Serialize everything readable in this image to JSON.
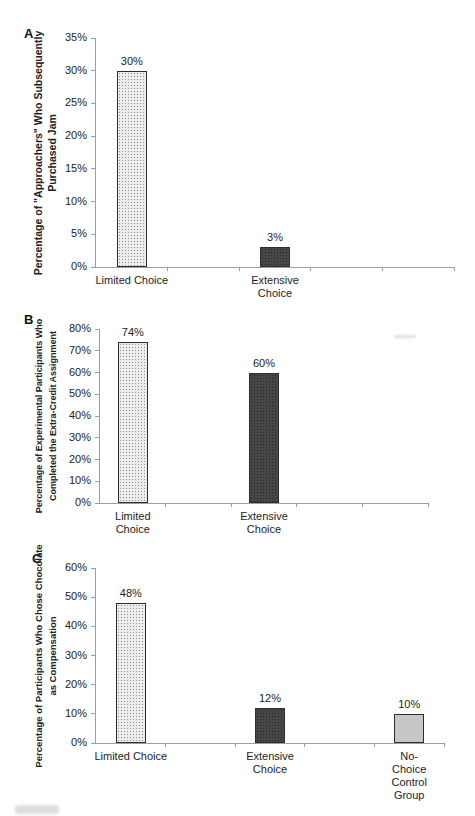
{
  "figure": {
    "background": "#ffffff",
    "panel_letters": [
      "A",
      "B",
      "C"
    ]
  },
  "palette": {
    "bar_stipple_bg": "#ececec",
    "bar_stipple_dot": "#8f8f8f",
    "bar_dark_bg": "#474747",
    "bar_dark_dot": "#262626",
    "bar_plain_gray": "#c5c8c6",
    "bar_border": "#2e2e2e",
    "axis_line": "#9e9e9e",
    "text": "#1c1c1c"
  },
  "chart_data": [
    {
      "type": "bar",
      "panel": "A",
      "title": "",
      "xlabel": "",
      "ylabel": "Percentage of \"Approachers\" Who Subsequently Purchased Jam",
      "ylabel_lines": [
        "Percentage of \"Approachers\" Who Subsequently",
        "Purchased Jam"
      ],
      "categories": [
        "Limited Choice",
        "Extensive\nChoice"
      ],
      "values": [
        30,
        3
      ],
      "value_labels": [
        "30%",
        "3%"
      ],
      "bar_styles": [
        "stipple",
        "dark"
      ],
      "ylim": [
        0,
        35
      ],
      "ytick_step": 5,
      "ytick_labels": [
        "0%",
        "5%",
        "10%",
        "15%",
        "20%",
        "25%",
        "30%",
        "35%"
      ],
      "grid": false,
      "legend": "none",
      "layout": {
        "panel_x": 24,
        "panel_y": 26,
        "plot_left": 95,
        "plot_top": 38,
        "plot_width": 358,
        "plot_height": 229,
        "ylabel_cx": 45,
        "ylabel_span": 256,
        "ylabel_font": 10.5,
        "bar_width": 30,
        "slots": 5,
        "bar_slots": [
          0,
          2
        ]
      }
    },
    {
      "type": "bar",
      "panel": "B",
      "title": "",
      "xlabel": "",
      "ylabel": "Percentage of Experimental Participants Who Completed the Extra-Credit Assignment",
      "ylabel_lines": [
        "Percentage of Experimental Participants Who",
        "Completed the Extra-Credit Assignment"
      ],
      "categories": [
        "Limited\nChoice",
        "Extensive\nChoice"
      ],
      "values": [
        74,
        60
      ],
      "value_labels": [
        "74%",
        "60%"
      ],
      "bar_styles": [
        "stipple",
        "dark"
      ],
      "ylim": [
        0,
        80
      ],
      "ytick_step": 10,
      "ytick_labels": [
        "0%",
        "10%",
        "20%",
        "30%",
        "40%",
        "50%",
        "60%",
        "70%",
        "80%"
      ],
      "grid": false,
      "legend": "none",
      "layout": {
        "panel_x": 24,
        "panel_y": 312,
        "plot_left": 99,
        "plot_top": 329,
        "plot_width": 328,
        "plot_height": 174,
        "ylabel_cx": 46,
        "ylabel_span": 206,
        "ylabel_font": 9,
        "bar_width": 30,
        "slots": 5,
        "bar_slots": [
          0,
          2
        ]
      }
    },
    {
      "type": "bar",
      "panel": "C",
      "title": "",
      "xlabel": "",
      "ylabel": "Percentage of Participants Who Chose Chocolate as Compensation",
      "ylabel_lines": [
        "Percentage of Participants Who Chose Chocolate",
        "as Compensation"
      ],
      "categories": [
        "Limited Choice",
        "Extensive\nChoice",
        "No-Choice\nControl Group"
      ],
      "values": [
        48,
        12,
        10
      ],
      "value_labels": [
        "48%",
        "12%",
        "10%"
      ],
      "bar_styles": [
        "stipple",
        "dark",
        "plain"
      ],
      "ylim": [
        0,
        60
      ],
      "ytick_step": 10,
      "ytick_labels": [
        "0%",
        "10%",
        "20%",
        "30%",
        "40%",
        "50%",
        "60%"
      ],
      "grid": false,
      "legend": "none",
      "layout": {
        "panel_x": 32,
        "panel_y": 551,
        "plot_left": 95,
        "plot_top": 568,
        "plot_width": 348,
        "plot_height": 175,
        "ylabel_cx": 46,
        "ylabel_span": 236,
        "ylabel_font": 9.5,
        "bar_width": 30,
        "slots": 5,
        "bar_slots": [
          0,
          2,
          4
        ]
      }
    }
  ]
}
